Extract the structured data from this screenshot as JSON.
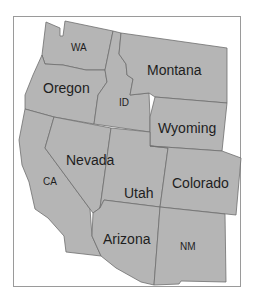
{
  "map": {
    "title": "Western United States",
    "fill_color": "#b5b5b5",
    "border_color": "#6e6e6e",
    "frame_color": "#9a9a9a",
    "states": [
      {
        "id": "wa",
        "label": "WA"
      },
      {
        "id": "or",
        "label": "Oregon"
      },
      {
        "id": "id",
        "label": "ID"
      },
      {
        "id": "mt",
        "label": "Montana"
      },
      {
        "id": "wy",
        "label": "Wyoming"
      },
      {
        "id": "ca",
        "label": "CA"
      },
      {
        "id": "nv",
        "label": "Nevada"
      },
      {
        "id": "ut",
        "label": "Utah"
      },
      {
        "id": "co",
        "label": "Colorado"
      },
      {
        "id": "az",
        "label": "Arizona"
      },
      {
        "id": "nm",
        "label": "NM"
      }
    ]
  }
}
